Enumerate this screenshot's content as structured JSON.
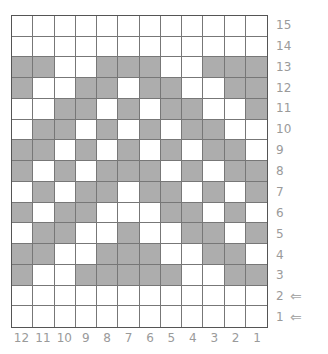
{
  "chart_data": {
    "type": "table",
    "columns": [
      "12",
      "11",
      "10",
      "9",
      "8",
      "7",
      "6",
      "5",
      "4",
      "3",
      "2",
      "1"
    ],
    "rows": [
      "15",
      "14",
      "13",
      "12",
      "11",
      "10",
      "9",
      "8",
      "7",
      "6",
      "5",
      "4",
      "3",
      "2",
      "1"
    ],
    "legend": {
      "G": "contrast color (gray)",
      "W": "main color (white)"
    },
    "grid": [
      "WWWWWWWWWWWW",
      "WWWWWWWWWWWW",
      "GGWWGGGWWGGG",
      "GWWGGWGGWWGG",
      "WWGGWGWGGWWG",
      "WGGWGWGWGGWW",
      "GGWGWGWGWGGW",
      "GWGWGGGWGWGG",
      "WGWGGWGGWGWG",
      "GWGGWWWGGWGW",
      "WGGWWGWWGGWG",
      "GGWWGGGWWGGW",
      "GWWGGGGGWWGG",
      "WWWWWWWWWWWW",
      "WWWWWWWWWWWW"
    ],
    "annotations": [
      {
        "row": "2",
        "mark": "arrow"
      },
      {
        "row": "1",
        "mark": "arrow"
      }
    ]
  },
  "colors": {
    "gray": "#adadad",
    "white": "#ffffff",
    "line": "#777777",
    "label": "#9a9a9a"
  },
  "arrow_glyph": "⇐"
}
